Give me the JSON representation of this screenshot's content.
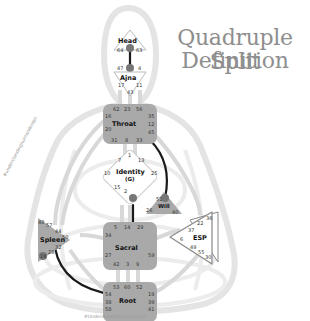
{
  "title": {
    "line1": "Quadruple Split",
    "line2": "Definition"
  },
  "colors": {
    "center_fill": "#a9a9a9",
    "center_undefined_fill": "#ffffff",
    "body_outline": "#e2e2e2",
    "channel_defined": "#1a1a1a",
    "channel_undefined": "#d6d6d6",
    "title_text": "#8e8e8e"
  },
  "centers": {
    "head": {
      "label": "Head",
      "gates": [
        "64",
        "61",
        "63"
      ]
    },
    "ajna": {
      "label": "Ajna",
      "gates": [
        "47",
        "24",
        "4",
        "17",
        "11",
        "43"
      ]
    },
    "throat": {
      "label": "Throat",
      "gates": [
        "62",
        "23",
        "56",
        "16",
        "35",
        "20",
        "12",
        "45",
        "31",
        "8",
        "33"
      ]
    },
    "identity": {
      "label": "Identity",
      "sublabel": "(G)",
      "gates": [
        "7",
        "1",
        "13",
        "10",
        "25",
        "15",
        "2",
        "46"
      ]
    },
    "will": {
      "label": "Will",
      "gates": [
        "21",
        "51",
        "26",
        "40"
      ]
    },
    "esp": {
      "label": "ESP",
      "gates": [
        "36",
        "22",
        "37",
        "6",
        "49",
        "55",
        "30"
      ]
    },
    "sacral": {
      "label": "Sacral",
      "gates": [
        "5",
        "14",
        "29",
        "34",
        "27",
        "59",
        "42",
        "3",
        "9"
      ]
    },
    "spleen": {
      "label": "Spleen",
      "gates": [
        "48",
        "57",
        "44",
        "50",
        "32",
        "28",
        "18"
      ]
    },
    "root": {
      "label": "Root",
      "gates": [
        "53",
        "60",
        "52",
        "54",
        "19",
        "38",
        "39",
        "58",
        "41"
      ]
    }
  },
  "watermarks": {
    "side": "#understandinghumandesign",
    "bottom": "#UnderstandHumanDesign"
  }
}
